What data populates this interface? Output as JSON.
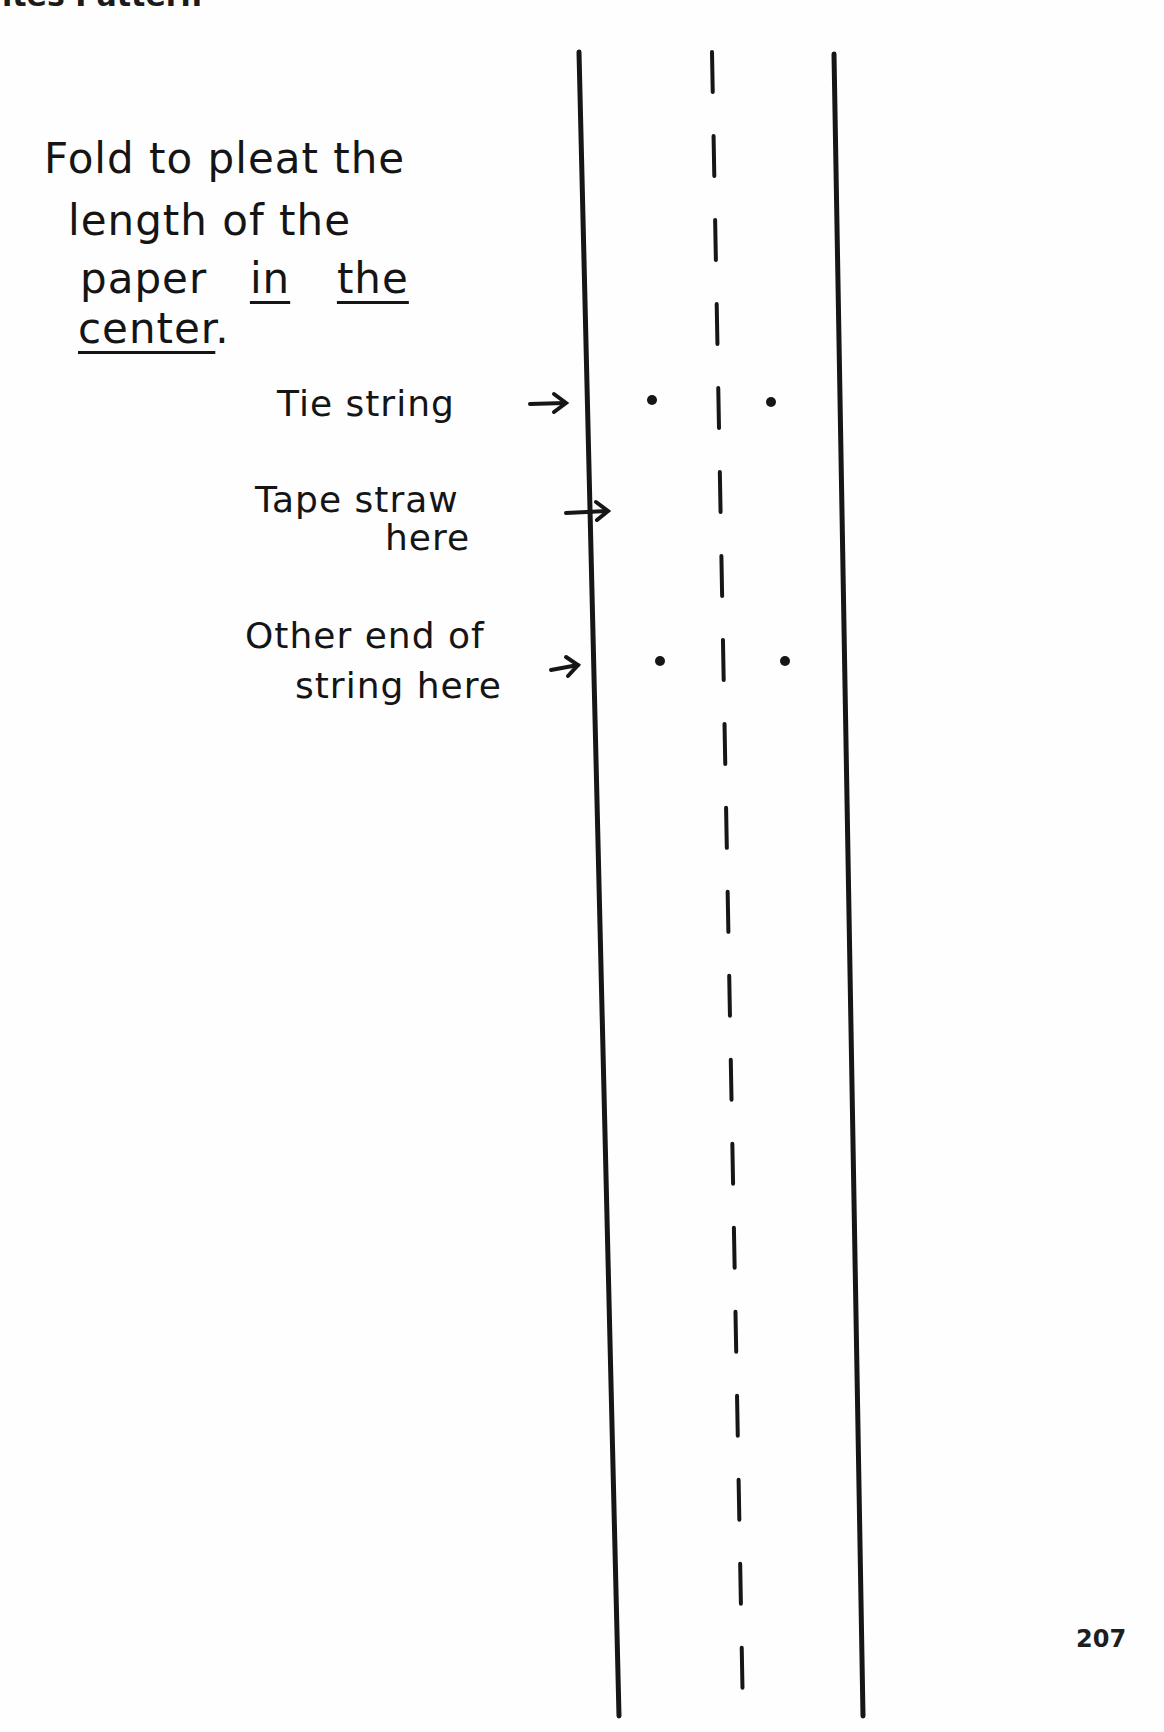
{
  "header": {
    "title_clipped": "ites Pattern"
  },
  "instructions": {
    "fold_lines": [
      "Fold to pleat the",
      "length of the",
      "paper",
      "in",
      "the",
      "center",
      "."
    ]
  },
  "labels": {
    "tie_string": "Tie string",
    "tape_straw_line1": "Tape straw",
    "tape_straw_line2": "here",
    "other_end_line1": "Other end of",
    "other_end_line2": "string here",
    "arrow": "→"
  },
  "diagram": {
    "line_color": "#161616",
    "left_line": {
      "x_top": 579,
      "x_bottom": 619
    },
    "fold_line_dashed": {
      "x_top": 712,
      "x_bottom": 743,
      "dash": 40,
      "gap": 44
    },
    "right_line": {
      "x_top": 834,
      "x_bottom": 863
    },
    "y_top": 52,
    "y_bottom": 1716,
    "dots": [
      {
        "x": 652,
        "y": 400
      },
      {
        "x": 771,
        "y": 402
      },
      {
        "x": 660,
        "y": 661
      },
      {
        "x": 785,
        "y": 661
      }
    ]
  },
  "footer": {
    "page_number": "207"
  }
}
